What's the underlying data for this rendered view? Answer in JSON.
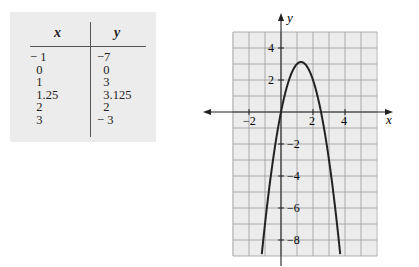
{
  "table": {
    "headers": {
      "x": "x",
      "y": "y"
    },
    "x_values": [
      "− 1",
      "  0",
      "  1",
      "  1.25",
      "  2",
      "  3"
    ],
    "y_values": [
      "−7",
      "  0",
      "  3",
      "  3.125",
      "  2",
      "− 3"
    ]
  },
  "graph": {
    "x_axis_label": "x",
    "y_axis_label": "y",
    "x_tick_labels": [
      "−2",
      "2",
      "4"
    ],
    "y_tick_labels": [
      "4",
      "2",
      "−2",
      "−4",
      "−6",
      "−8"
    ]
  },
  "chart_data": {
    "type": "line",
    "title": "",
    "xlabel": "x",
    "ylabel": "y",
    "xlim": [
      -3,
      6
    ],
    "ylim": [
      -9,
      5
    ],
    "grid": true,
    "table_points": [
      {
        "x": -1,
        "y": -7
      },
      {
        "x": 0,
        "y": 0
      },
      {
        "x": 1,
        "y": 3
      },
      {
        "x": 1.25,
        "y": 3.125
      },
      {
        "x": 2,
        "y": 2
      },
      {
        "x": 3,
        "y": -3
      }
    ],
    "series": [
      {
        "name": "y = 5x - 2x^2",
        "x": [
          -1,
          0,
          1,
          1.25,
          2,
          3
        ],
        "y": [
          -7,
          0,
          3,
          3.125,
          2,
          -3
        ]
      }
    ],
    "x_ticks": [
      -2,
      2,
      4
    ],
    "y_ticks": [
      4,
      2,
      -2,
      -4,
      -6,
      -8
    ]
  }
}
